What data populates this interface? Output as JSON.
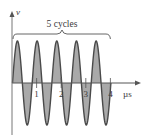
{
  "figure": {
    "y_axis_label": "v",
    "x_axis_unit": "µs",
    "annotation": "5 cycles",
    "x_ticks": [
      "1",
      "2",
      "3",
      "4"
    ]
  },
  "chart_data": {
    "type": "line",
    "title": "",
    "xlabel": "µs",
    "ylabel": "v",
    "annotation": "5 cycles",
    "x_tick_labels": [
      "1",
      "2",
      "3",
      "4"
    ],
    "xlim": [
      0,
      4.6
    ],
    "cycles": 5,
    "duration_us": 4,
    "period_us": 0.8,
    "frequency_MHz": 1.25,
    "waveform": "sine",
    "fill": "shaded area between curve and axis",
    "grid": false,
    "colors": {
      "fill": "#a9a9a9",
      "stroke": "#4a4a4a",
      "axis": "#555555"
    }
  }
}
